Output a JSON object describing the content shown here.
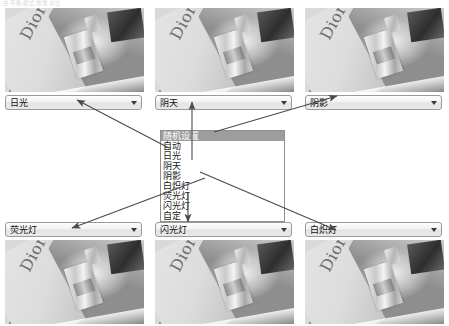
{
  "page": {
    "top_caption": "白平衡模式效果对比"
  },
  "samples_top": [
    {
      "name": "sample-daylight",
      "label": "日光",
      "wordmark": "Dior"
    },
    {
      "name": "sample-cloudy",
      "label": "阴天",
      "wordmark": "Dior"
    },
    {
      "name": "sample-shade",
      "label": "阴影",
      "wordmark": "Dior"
    }
  ],
  "samples_bottom": [
    {
      "name": "sample-fluorescent",
      "label": "荧光灯",
      "wordmark": "Dior"
    },
    {
      "name": "sample-flash",
      "label": "闪光灯",
      "wordmark": "Dior"
    },
    {
      "name": "sample-incandescent",
      "label": "白炽灯",
      "wordmark": "Dior"
    }
  ],
  "dropdown": {
    "name": "white-balance-dropdown",
    "items": [
      {
        "label": "随机设置",
        "selected": true
      },
      {
        "label": "自动",
        "selected": false
      },
      {
        "label": "日光",
        "selected": false
      },
      {
        "label": "阴天",
        "selected": false
      },
      {
        "label": "阴影",
        "selected": false
      },
      {
        "label": "白炽灯",
        "selected": false
      },
      {
        "label": "荧光灯",
        "selected": false
      },
      {
        "label": "闪光灯",
        "selected": false
      },
      {
        "label": "自定",
        "selected": false
      }
    ]
  },
  "combo": {
    "arrow_icon": "chevron-down-icon"
  }
}
